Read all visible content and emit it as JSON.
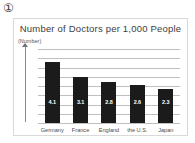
{
  "marker": {
    "label": "①"
  },
  "chart_data": {
    "type": "bar",
    "title": "Number of Doctors per 1,000 People",
    "xlabel": "",
    "ylabel": "(Number)",
    "ylim": [
      0,
      5
    ],
    "grid": true,
    "legend": "none",
    "categories": [
      "Germany",
      "France",
      "England",
      "the U.S.",
      "Japan"
    ],
    "values": [
      4.1,
      3.1,
      2.8,
      2.6,
      2.3
    ],
    "value_labels": [
      "4.1",
      "3.1",
      "2.8",
      "2.6",
      "2.3"
    ],
    "bar_color": "#1b1b1b",
    "gridline_color": "#bfbfbf",
    "gridline_count": 9
  }
}
